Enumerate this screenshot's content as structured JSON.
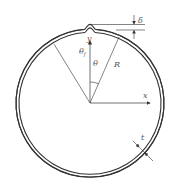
{
  "diagram": {
    "labels": {
      "delta": "δ",
      "y_axis": "y",
      "x_axis": "x",
      "theta": "θ",
      "theta_f": "θ",
      "theta_f_sub": "f",
      "radius": "R",
      "thickness": "t"
    },
    "colors": {
      "stroke": "#333333",
      "text": "#555555",
      "background": "#ffffff"
    }
  }
}
